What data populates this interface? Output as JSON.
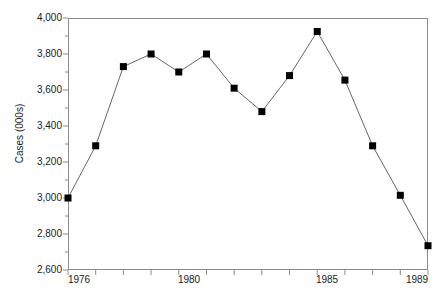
{
  "chart_data": {
    "type": "line",
    "title": "",
    "xlabel": "",
    "ylabel": "Cases (000s)",
    "x": [
      1976,
      1977,
      1978,
      1979,
      1980,
      1981,
      1982,
      1983,
      1984,
      1985,
      1986,
      1987,
      1988,
      1989
    ],
    "values": [
      3000,
      3290,
      3730,
      3800,
      3700,
      3800,
      3610,
      3480,
      3680,
      3925,
      3655,
      3290,
      3015,
      2735
    ],
    "series": [
      {
        "name": "Cases",
        "values": [
          3000,
          3290,
          3730,
          3800,
          3700,
          3800,
          3610,
          3480,
          3680,
          3925,
          3655,
          3290,
          3015,
          2735
        ]
      }
    ],
    "xlim": [
      1976,
      1989
    ],
    "ylim": [
      2600,
      4000
    ],
    "ytick_labels": [
      "4,000",
      "3,800",
      "3,600",
      "3,400",
      "3,200",
      "3,000",
      "2,800",
      "2,600"
    ],
    "ytick_values": [
      4000,
      3800,
      3600,
      3400,
      3200,
      3000,
      2800,
      2600
    ],
    "yminor_values": [
      3900,
      3700,
      3500,
      3300,
      3100,
      2900,
      2700
    ],
    "xtick_values": [
      1976,
      1977,
      1978,
      1979,
      1980,
      1981,
      1982,
      1983,
      1984,
      1985,
      1986,
      1987,
      1988,
      1989
    ],
    "xtick_labels": [
      {
        "value": 1976,
        "label": "1976"
      },
      {
        "value": 1980,
        "label": "1980"
      },
      {
        "value": 1985,
        "label": "1985"
      },
      {
        "value": 1989,
        "label": "1989"
      }
    ],
    "grid": false,
    "legend": false,
    "legend_position": "none",
    "marker": "square",
    "marker_color": "#000000",
    "line_color": "#666666",
    "frame_color": "#8c8c8c",
    "background": "#ffffff"
  }
}
